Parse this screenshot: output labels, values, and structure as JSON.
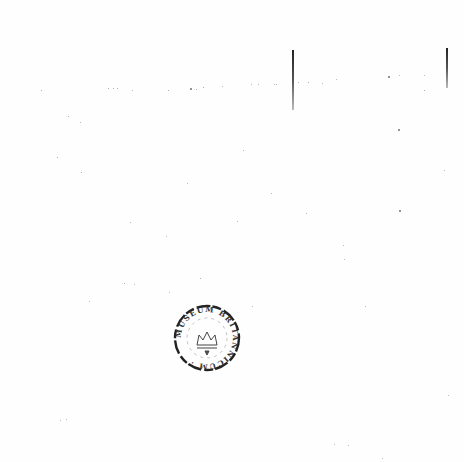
{
  "document": {
    "type": "scanned-blank-page",
    "background": "#fefefe",
    "ink_color": "#222222"
  },
  "rule_lines": [
    {
      "x": 292,
      "y1": 50,
      "y2": 110
    },
    {
      "x": 446,
      "y1": 48,
      "y2": 88
    }
  ],
  "stamp": {
    "shape": "circle",
    "label": "library stamp",
    "center_emblem": "crown-icon",
    "ring_text": "MUSEUM BRITANNICUM"
  },
  "specks": [
    [
      41,
      90,
      1.2
    ],
    [
      108,
      88,
      1.3
    ],
    [
      113,
      88,
      1.3
    ],
    [
      117,
      88,
      1.3
    ],
    [
      132,
      90,
      1
    ],
    [
      168,
      90,
      1.3
    ],
    [
      190,
      88,
      1.8
    ],
    [
      196,
      89,
      1.3
    ],
    [
      203,
      87,
      1.2
    ],
    [
      222,
      86,
      1
    ],
    [
      251,
      84,
      1
    ],
    [
      258,
      84,
      1
    ],
    [
      274,
      84,
      1
    ],
    [
      276,
      84,
      1
    ],
    [
      298,
      82,
      1
    ],
    [
      308,
      82,
      1.2
    ],
    [
      322,
      83,
      1
    ],
    [
      336,
      79,
      1
    ],
    [
      388,
      76,
      1.6
    ],
    [
      399,
      75,
      1
    ],
    [
      424,
      75,
      1
    ],
    [
      424,
      90,
      1.3
    ],
    [
      68,
      116,
      1.2
    ],
    [
      80,
      122,
      1
    ],
    [
      57,
      157,
      1.3
    ],
    [
      81,
      172,
      1.4
    ],
    [
      243,
      150,
      1
    ],
    [
      271,
      193,
      1
    ],
    [
      187,
      183,
      1
    ],
    [
      398,
      129,
      1.6
    ],
    [
      399,
      210,
      1.6
    ],
    [
      306,
      213,
      1
    ],
    [
      130,
      222,
      1
    ],
    [
      237,
      221,
      1
    ],
    [
      444,
      170,
      1
    ],
    [
      166,
      236,
      1
    ],
    [
      343,
      245,
      1
    ],
    [
      344,
      259,
      1
    ],
    [
      124,
      283,
      1.3
    ],
    [
      134,
      284,
      1
    ],
    [
      200,
      278,
      1.2
    ],
    [
      169,
      292,
      1
    ],
    [
      89,
      301,
      1
    ],
    [
      252,
      306,
      1
    ],
    [
      365,
      306,
      1
    ],
    [
      60,
      420,
      1
    ],
    [
      66,
      419,
      1
    ],
    [
      334,
      444,
      1
    ],
    [
      348,
      445,
      1
    ],
    [
      382,
      458,
      1
    ],
    [
      448,
      395,
      1
    ]
  ]
}
